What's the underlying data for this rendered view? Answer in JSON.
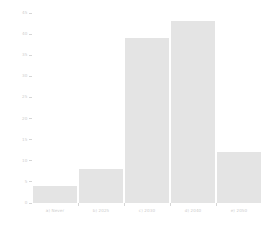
{
  "chart_data": {
    "type": "bar",
    "title": "",
    "subtitle": "",
    "xlabel": "",
    "ylabel": "",
    "categories": [
      "a) Never",
      "b) 2025",
      "c) 2030",
      "d) 2040",
      "e) 2050"
    ],
    "values": [
      4,
      8,
      39,
      43,
      12
    ],
    "ylim": [
      0,
      45
    ],
    "ytick_labels": [
      "0",
      "5",
      "10",
      "15",
      "20",
      "25",
      "30",
      "35",
      "40",
      "45"
    ],
    "ytick_values": [
      0,
      5,
      10,
      15,
      20,
      25,
      30,
      35,
      40,
      45
    ],
    "grid": false,
    "legend": null,
    "legend_position": "none",
    "bar_color": "#e4e4e4",
    "axis_color": "#d6d6d6",
    "tick_label_color": "#cdcdcd",
    "background_color": "#ffffff",
    "annotations": []
  }
}
